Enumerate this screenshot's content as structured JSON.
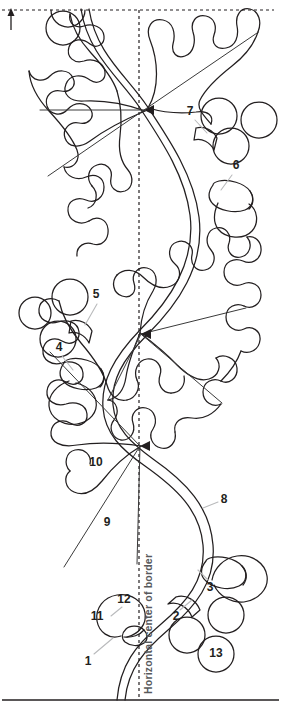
{
  "diagram": {
    "ink_color": "#231f20",
    "leader_color": "#b9babc",
    "guide_color": "#231f20",
    "axis_label_color": "#58595b",
    "background_color": "#ffffff"
  },
  "guides": {
    "top_dashed_line": "top edge dashed guide line",
    "vertical_dashed_line": "horizontal center of border dashed guide line",
    "bottom_solid_line": "bottom solid border edge line",
    "up_arrow": "up-arrow-icon",
    "center_label": "Horizontal center of border"
  },
  "callouts": [
    {
      "id": "1",
      "label": "1",
      "x": 88,
      "y": 662
    },
    {
      "id": "2",
      "label": "2",
      "x": 176,
      "y": 617
    },
    {
      "id": "3",
      "label": "3",
      "x": 210,
      "y": 588
    },
    {
      "id": "4",
      "label": "4",
      "x": 59,
      "y": 348
    },
    {
      "id": "5",
      "label": "5",
      "x": 96,
      "y": 295
    },
    {
      "id": "6",
      "label": "6",
      "x": 236,
      "y": 166
    },
    {
      "id": "7",
      "label": "7",
      "x": 190,
      "y": 112
    },
    {
      "id": "8",
      "label": "8",
      "x": 224,
      "y": 500
    },
    {
      "id": "9",
      "label": "9",
      "x": 107,
      "y": 523
    },
    {
      "id": "10",
      "label": "10",
      "x": 96,
      "y": 463
    },
    {
      "id": "11",
      "label": "11",
      "x": 97,
      "y": 617
    },
    {
      "id": "12",
      "label": "12",
      "x": 124,
      "y": 600
    },
    {
      "id": "13",
      "label": "13",
      "x": 216,
      "y": 654
    }
  ],
  "shapes": {
    "leaves": [
      {
        "name": "oak-leaf-upper-right",
        "note": "upper leaf pointing right from stem junction"
      },
      {
        "name": "oak-leaf-upper-left",
        "note": "upper leaf pointing left from stem junction"
      },
      {
        "name": "oak-leaf-middle-right",
        "note": "middle leaf pointing right"
      },
      {
        "name": "oak-leaf-lower-left",
        "note": "lower leaf pointing left"
      }
    ],
    "acorns": [
      {
        "name": "acorn-upper-right",
        "callout": "6"
      },
      {
        "name": "acorn-middle-left",
        "callout": "4"
      },
      {
        "name": "acorn-lower-right",
        "callout": "3"
      },
      {
        "name": "acorn-lower-left",
        "callout": "11"
      }
    ],
    "circles": [
      {
        "name": "circle-top-partial"
      },
      {
        "name": "circle-top-left"
      },
      {
        "name": "circle-upper-right-a",
        "callout": "7"
      },
      {
        "name": "circle-upper-right-b"
      },
      {
        "name": "circle-upper-right-c"
      },
      {
        "name": "circle-middle-left-a",
        "callout": "5"
      },
      {
        "name": "circle-middle-left-b"
      },
      {
        "name": "circle-middle-left-c"
      },
      {
        "name": "circle-lower-right-a",
        "callout": "2"
      },
      {
        "name": "circle-lower-right-b"
      },
      {
        "name": "circle-lower-right-numbered",
        "callout": "13"
      }
    ],
    "vine": {
      "name": "serpentine-double-line-vine"
    }
  }
}
